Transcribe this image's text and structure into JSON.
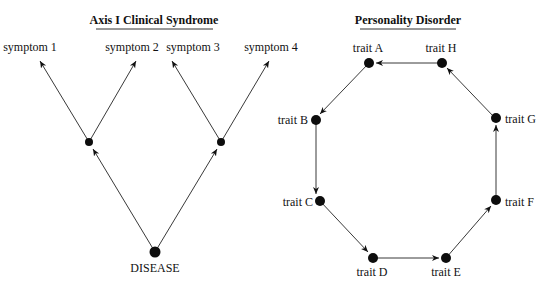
{
  "left_panel": {
    "title": "Axis I Clinical Syndrome",
    "root_label": "DISEASE",
    "symptoms": [
      "symptom 1",
      "symptom 2",
      "symptom 3",
      "symptom 4"
    ]
  },
  "right_panel": {
    "title": "Personality Disorder",
    "traits": {
      "A": "trait A",
      "B": "trait B",
      "C": "trait C",
      "D": "trait D",
      "E": "trait E",
      "F": "trait F",
      "G": "trait G",
      "H": "trait H"
    },
    "cycle_order": [
      "A",
      "B",
      "C",
      "D",
      "E",
      "F",
      "G",
      "H"
    ]
  },
  "colors": {
    "line": "#222222",
    "node": "#0d0d0d",
    "text": "#111111"
  }
}
